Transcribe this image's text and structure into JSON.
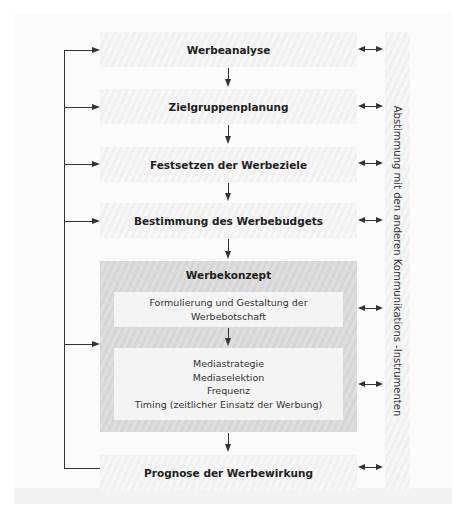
{
  "diagram": {
    "steps": [
      {
        "label": "Werbeanalyse"
      },
      {
        "label": "Zielgruppenplanung"
      },
      {
        "label": "Festsetzen der Werbeziele"
      },
      {
        "label": "Bestimmung des Werbebudgets"
      }
    ],
    "concept": {
      "title": "Werbekonzept",
      "message_box": {
        "line1": "Formulierung und Gestaltung der",
        "line2": "Werbebotschaft"
      },
      "media_box": {
        "lines": [
          "Mediastrategie",
          "Mediaselektion",
          "Frequenz",
          "Timing (zeitlicher Einsatz der Werbung)"
        ]
      }
    },
    "final_step": {
      "label": "Prognose der Werbewirkung"
    },
    "side_label": "Abstimmung mit den anderen Kommunikations -Instrumenten",
    "colors": {
      "panel": "#fbfbfb",
      "step_box": "#f4f4f4",
      "concept_box": "#d9d9d9",
      "lines": "#333333"
    }
  }
}
